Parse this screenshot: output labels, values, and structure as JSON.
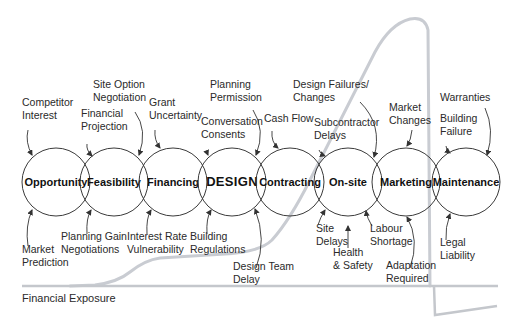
{
  "diagram": {
    "stages": [
      {
        "id": "opportunity",
        "label": "Opportunity",
        "cx": 56
      },
      {
        "id": "feasibility",
        "label": "Feasibility",
        "cx": 114
      },
      {
        "id": "financing",
        "label": "Financing",
        "cx": 173
      },
      {
        "id": "design",
        "label": "DESIGN",
        "cx": 232,
        "emphasis": true
      },
      {
        "id": "contracting",
        "label": "Contracting",
        "cx": 290
      },
      {
        "id": "on-site",
        "label": "On-site",
        "cx": 348
      },
      {
        "id": "marketing",
        "label": "Marketing",
        "cx": 406
      },
      {
        "id": "maintenance",
        "label": "Maintenance",
        "cx": 466
      }
    ],
    "circle_cy": 182,
    "circle_r": 34,
    "risks_above": [
      {
        "lines": [
          "Competitor",
          "Interest"
        ],
        "x": 22,
        "y": 106
      },
      {
        "lines": [
          "Financial",
          "Projection"
        ],
        "x": 81,
        "y": 117
      },
      {
        "lines": [
          "Site Option",
          "Negotiation"
        ],
        "x": 93,
        "y": 88
      },
      {
        "lines": [
          "Grant",
          "Uncertainty"
        ],
        "x": 149,
        "y": 106
      },
      {
        "lines": [
          "Planning",
          "Permission"
        ],
        "x": 210,
        "y": 88
      },
      {
        "lines": [
          "Conversation",
          "Consents"
        ],
        "x": 201,
        "y": 125
      },
      {
        "lines": [
          "Cash Flow"
        ],
        "x": 264,
        "y": 122
      },
      {
        "lines": [
          "Design Failures/",
          "Changes"
        ],
        "x": 293,
        "y": 88
      },
      {
        "lines": [
          "Subcontractor",
          "Delays"
        ],
        "x": 314,
        "y": 126
      },
      {
        "lines": [
          "Market",
          "Changes"
        ],
        "x": 389,
        "y": 111
      },
      {
        "lines": [
          "Warranties"
        ],
        "x": 440,
        "y": 101
      },
      {
        "lines": [
          "Building",
          "Failure"
        ],
        "x": 440,
        "y": 122
      }
    ],
    "risks_below": [
      {
        "lines": [
          "Market",
          "Prediction"
        ],
        "x": 22,
        "y": 253
      },
      {
        "lines": [
          "Planning Gain",
          "Negotiations"
        ],
        "x": 61,
        "y": 240
      },
      {
        "lines": [
          "Interest Rate",
          "Vulnerability"
        ],
        "x": 127,
        "y": 240
      },
      {
        "lines": [
          "Building",
          "Regulations"
        ],
        "x": 190,
        "y": 240
      },
      {
        "lines": [
          "Design Team",
          "Delay"
        ],
        "x": 233,
        "y": 270
      },
      {
        "lines": [
          "Site",
          "Delays"
        ],
        "x": 316,
        "y": 232
      },
      {
        "lines": [
          "Health",
          "& Safety"
        ],
        "x": 333,
        "y": 256
      },
      {
        "lines": [
          "Labour",
          "Shortage"
        ],
        "x": 370,
        "y": 232
      },
      {
        "lines": [
          "Adaptation",
          "Required"
        ],
        "x": 386,
        "y": 269
      },
      {
        "lines": [
          "Legal",
          "Liability"
        ],
        "x": 440,
        "y": 246
      }
    ],
    "axis_label": "Financial Exposure",
    "colors": {
      "circle_stroke": "#3a3a3a",
      "exposure_curve": "#c9ccd2",
      "text": "#2a2a2a"
    }
  }
}
